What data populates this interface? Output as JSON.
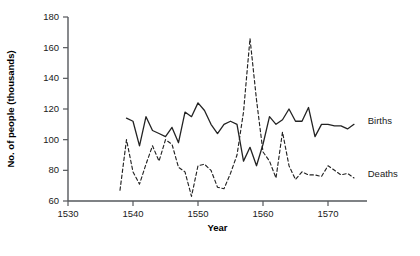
{
  "chart_data": {
    "type": "line",
    "title": "",
    "xlabel": "Year",
    "ylabel": "No. of people (thousands)",
    "xlim": [
      1528,
      1576
    ],
    "ylim": [
      60,
      180
    ],
    "xticks": [
      1530,
      1540,
      1550,
      1560,
      1570
    ],
    "yticks": [
      60,
      80,
      100,
      120,
      140,
      160,
      180
    ],
    "grid": false,
    "legend_position": "right-inline",
    "series": [
      {
        "name": "Births",
        "style": "solid",
        "color": "#232323",
        "x": [
          1539,
          1540,
          1541,
          1542,
          1543,
          1544,
          1545,
          1546,
          1547,
          1548,
          1549,
          1550,
          1551,
          1552,
          1553,
          1554,
          1555,
          1556,
          1557,
          1558,
          1559,
          1560,
          1561,
          1562,
          1563,
          1564,
          1565,
          1566,
          1567,
          1568,
          1569,
          1570,
          1571,
          1572,
          1573,
          1574
        ],
        "y": [
          114,
          112,
          96,
          115,
          106,
          104,
          102,
          108,
          98,
          118,
          115,
          124,
          119,
          110,
          104,
          110,
          112,
          110,
          86,
          95,
          83,
          97,
          115,
          110,
          113,
          120,
          112,
          112,
          121,
          102,
          110,
          110,
          109,
          109,
          107,
          110
        ]
      },
      {
        "name": "Deaths",
        "style": "dashed",
        "color": "#232323",
        "x": [
          1538,
          1539,
          1540,
          1541,
          1542,
          1543,
          1544,
          1545,
          1546,
          1547,
          1548,
          1549,
          1550,
          1551,
          1552,
          1553,
          1554,
          1555,
          1556,
          1557,
          1558,
          1559,
          1560,
          1561,
          1562,
          1563,
          1564,
          1565,
          1566,
          1567,
          1568,
          1569,
          1570,
          1571,
          1572,
          1573,
          1574
        ],
        "y": [
          67,
          100,
          79,
          71,
          84,
          96,
          86,
          100,
          97,
          82,
          79,
          63,
          83,
          84,
          80,
          69,
          68,
          78,
          90,
          118,
          166,
          126,
          92,
          86,
          75,
          105,
          83,
          74,
          79,
          77,
          77,
          76,
          83,
          80,
          77,
          78,
          75
        ]
      }
    ],
    "annotations": [
      {
        "name": "births-label",
        "text": "Births",
        "x": 1575.5,
        "y": 112
      },
      {
        "name": "deaths-label",
        "text": "Deaths",
        "x": 1575.5,
        "y": 77
      }
    ]
  }
}
